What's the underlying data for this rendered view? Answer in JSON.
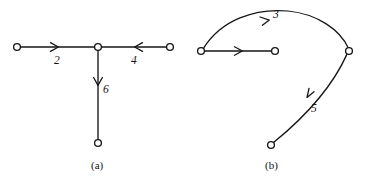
{
  "figure": {
    "background_color": "#ffffff",
    "stroke_color": "#161616",
    "node_fill_color": "#ffffff",
    "panels": [
      {
        "id": "panel-a",
        "caption": "(a)",
        "caption_x": 91,
        "caption_y": 160,
        "nodes": [
          {
            "name": "node-a-left",
            "x": 17,
            "y": 47,
            "r": 3.4
          },
          {
            "name": "node-a-center",
            "x": 98,
            "y": 47,
            "r": 3.4
          },
          {
            "name": "node-a-right",
            "x": 170,
            "y": 47,
            "r": 3.4
          },
          {
            "name": "node-a-bottom",
            "x": 98,
            "y": 143,
            "r": 3.4
          }
        ],
        "edges": [
          {
            "name": "edge-a-left-to-center",
            "from": "node-a-left",
            "to": "node-a-center",
            "weight": "2",
            "label_x": 54,
            "label_y": 55,
            "direction": "right",
            "arrow_x": 57,
            "arrow_y": 47
          },
          {
            "name": "edge-a-right-to-center",
            "from": "node-a-right",
            "to": "node-a-center",
            "weight": "4",
            "label_x": 131,
            "label_y": 55,
            "direction": "left",
            "arrow_x": 135,
            "arrow_y": 47
          },
          {
            "name": "edge-a-center-to-bottom",
            "from": "node-a-center",
            "to": "node-a-bottom",
            "weight": "6",
            "label_x": 103,
            "label_y": 84,
            "direction": "down",
            "arrow_x": 98,
            "arrow_y": 85
          }
        ]
      },
      {
        "id": "panel-b",
        "caption": "(b)",
        "caption_x": 265,
        "caption_y": 160,
        "nodes": [
          {
            "name": "node-b-left",
            "x": 201,
            "y": 51,
            "r": 3.4
          },
          {
            "name": "node-b-middle",
            "x": 275,
            "y": 51,
            "r": 3.4
          },
          {
            "name": "node-b-right",
            "x": 349,
            "y": 51,
            "r": 3.4
          },
          {
            "name": "node-b-bottom",
            "x": 271,
            "y": 145,
            "r": 3.4
          }
        ],
        "edges": [
          {
            "name": "edge-b-left-to-middle",
            "from": "node-b-left",
            "to": "node-b-middle",
            "weight": "",
            "label_x": 0,
            "label_y": 0,
            "direction": "right",
            "arrow_x": 242,
            "arrow_y": 51
          },
          {
            "name": "edge-b-left-to-right-arc",
            "from": "node-b-left",
            "to": "node-b-right",
            "weight": "3",
            "label_x": 273,
            "label_y": 9,
            "direction": "arc-right",
            "arrow_x": 268,
            "arrow_y": 22
          },
          {
            "name": "edge-b-right-to-bottom",
            "from": "node-b-right",
            "to": "node-b-bottom",
            "weight": "5",
            "label_x": 311,
            "label_y": 103,
            "direction": "down-left",
            "arrow_x": 308,
            "arrow_y": 96
          }
        ]
      }
    ]
  }
}
